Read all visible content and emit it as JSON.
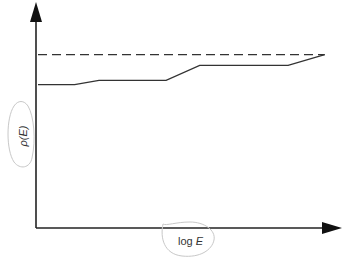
{
  "chart_data": {
    "type": "line",
    "title": "",
    "xlabel": "log E",
    "ylabel": "ρ(E)",
    "xlim": [
      0,
      1
    ],
    "ylim": [
      0,
      1
    ],
    "grid": false,
    "legend": "none",
    "ticks": {
      "x": [],
      "y": []
    },
    "series": [
      {
        "name": "reference level",
        "style": "dashed",
        "x": [
          0.0,
          0.94
        ],
        "y": [
          0.81,
          0.81
        ]
      },
      {
        "name": "rho(E)",
        "style": "solid",
        "x": [
          0.0,
          0.12,
          0.2,
          0.42,
          0.53,
          0.82,
          0.94
        ],
        "y": [
          0.67,
          0.67,
          0.69,
          0.69,
          0.76,
          0.76,
          0.81
        ]
      }
    ]
  },
  "labels": {
    "x_axis_text_main": "log ",
    "x_axis_text_var": "E",
    "y_axis_text": "ρ(E)"
  }
}
